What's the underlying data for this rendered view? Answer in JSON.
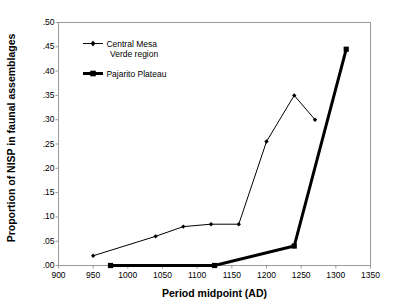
{
  "chart_data": {
    "type": "line",
    "title": "",
    "xlabel": "Period midpoint (AD)",
    "ylabel": "Proportion of NISP in faunal assemblages",
    "xlim": [
      900,
      1350
    ],
    "ylim": [
      0.0,
      0.5
    ],
    "xticks": [
      "900",
      "950",
      "1000",
      "1050",
      "1100",
      "1150",
      "1200",
      "1250",
      "1300",
      "1350"
    ],
    "xtick_values": [
      900,
      950,
      1000,
      1050,
      1100,
      1150,
      1200,
      1250,
      1300,
      1350
    ],
    "yticks": [
      ".00",
      ".05",
      ".10",
      ".15",
      ".20",
      ".25",
      ".30",
      ".35",
      ".40",
      ".45",
      ".50"
    ],
    "ytick_values": [
      0.0,
      0.05,
      0.1,
      0.15,
      0.2,
      0.25,
      0.3,
      0.35,
      0.4,
      0.45,
      0.5
    ],
    "grid": false,
    "legend_position": "upper-left-inside",
    "series": [
      {
        "name": "Central Mesa Verde region",
        "legend_label_line1": "Central Mesa",
        "legend_label_line2": "Verde region",
        "style": "thin-line-with-markers",
        "color": "#000000",
        "line_width": 1,
        "marker": "diamond-small",
        "x": [
          950,
          1040,
          1080,
          1120,
          1160,
          1200,
          1240,
          1270
        ],
        "y": [
          0.02,
          0.06,
          0.08,
          0.085,
          0.085,
          0.255,
          0.35,
          0.3
        ]
      },
      {
        "name": "Pajarito Plateau",
        "legend_label_line1": "Pajarito Plateau",
        "legend_label_line2": "",
        "style": "thick-line-with-markers",
        "color": "#000000",
        "line_width": 3,
        "marker": "square-small",
        "x": [
          975,
          1125,
          1240,
          1315
        ],
        "y": [
          0.0,
          0.0,
          0.04,
          0.445
        ]
      }
    ]
  },
  "axis": {
    "xlabel": "Period midpoint (AD)",
    "ylabel": "Proportion of NISP in faunal assemblages"
  }
}
